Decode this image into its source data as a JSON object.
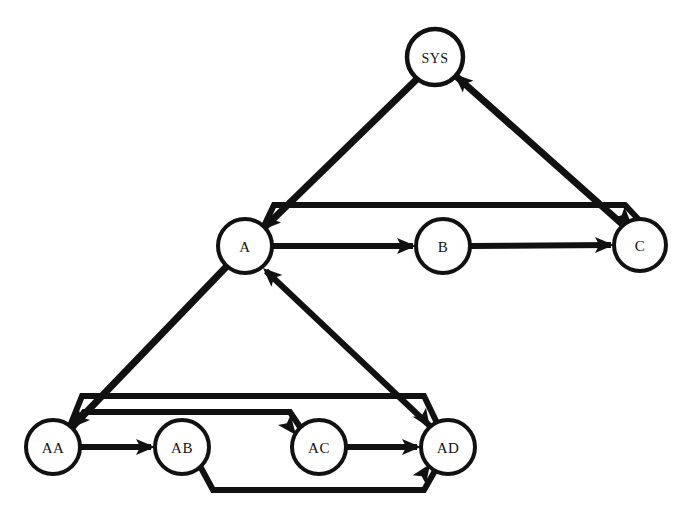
{
  "diagram": {
    "background_color": "#ffffff",
    "stroke_color": "#111111",
    "fill_color": "#ffffff",
    "width": 688,
    "height": 522,
    "nodes": [
      {
        "id": "SYS",
        "label": "SYS",
        "cx": 435,
        "cy": 57,
        "r": 28,
        "level": 0
      },
      {
        "id": "A",
        "label": "A",
        "cx": 245,
        "cy": 246,
        "r": 27,
        "level": 1
      },
      {
        "id": "B",
        "label": "B",
        "cx": 443,
        "cy": 246,
        "r": 27,
        "level": 1
      },
      {
        "id": "C",
        "label": "C",
        "cx": 640,
        "cy": 245,
        "r": 26,
        "level": 1
      },
      {
        "id": "AA",
        "label": "AA",
        "cx": 53,
        "cy": 447,
        "r": 27,
        "level": 2
      },
      {
        "id": "AB",
        "label": "AB",
        "cx": 182,
        "cy": 447,
        "r": 27,
        "level": 2
      },
      {
        "id": "AC",
        "label": "AC",
        "cx": 319,
        "cy": 447,
        "r": 27,
        "level": 2
      },
      {
        "id": "AD",
        "label": "AD",
        "cx": 448,
        "cy": 447,
        "r": 27,
        "level": 2
      }
    ],
    "edges": [
      {
        "id": "sys-a",
        "from": "SYS",
        "to": "A",
        "kind": "diagonal",
        "stroke_width": 7,
        "path": "M 417 79 L 265 227",
        "arrow_at": [
          262,
          230
        ],
        "arrow_angle": 135.5
      },
      {
        "id": "c-sys",
        "from": "C",
        "to": "SYS",
        "kind": "diagonal",
        "stroke_width": 7,
        "path": "M 622 224 L 457 77",
        "arrow_at": [
          454,
          74
        ],
        "arrow_angle": 221.7
      },
      {
        "id": "a-b",
        "from": "A",
        "to": "B",
        "kind": "straight",
        "stroke_width": 6,
        "path": "M 272 246 L 413 246",
        "arrow_at": [
          416,
          246
        ],
        "arrow_angle": 0
      },
      {
        "id": "b-c",
        "from": "B",
        "to": "C",
        "kind": "straight",
        "stroke_width": 6,
        "path": "M 470 246 L 611 245",
        "arrow_at": [
          614,
          245
        ],
        "arrow_angle": 0
      },
      {
        "id": "a-c",
        "from": "A",
        "to": "C",
        "kind": "bypass-over",
        "stroke_width": 6,
        "path": "M 263 228 L 274 205 L 625 205 L 640 221",
        "arrow_at": [
          632,
          226
        ],
        "arrow_angle": 46
      },
      {
        "id": "a-aa",
        "from": "A",
        "to": "AA",
        "kind": "diagonal",
        "stroke_width": 7,
        "path": "M 227 266 L 75 424",
        "arrow_at": [
          71,
          428
        ],
        "arrow_angle": 134
      },
      {
        "id": "ad-a",
        "from": "AD",
        "to": "A",
        "kind": "diagonal",
        "stroke_width": 6,
        "path": "M 432 428 L 266 271",
        "arrow_at": [
          263,
          268
        ],
        "arrow_angle": 223
      },
      {
        "id": "aa-ab",
        "from": "AA",
        "to": "AB",
        "kind": "straight",
        "stroke_width": 6,
        "path": "M 80 447 L 151 447",
        "arrow_at": [
          155,
          447
        ],
        "arrow_angle": 0
      },
      {
        "id": "ac-ad",
        "from": "AC",
        "to": "AD",
        "kind": "straight",
        "stroke_width": 6,
        "path": "M 346 447 L 417 447",
        "arrow_at": [
          421,
          447
        ],
        "arrow_angle": 0
      },
      {
        "id": "aa-ac",
        "from": "AA",
        "to": "AC",
        "kind": "bypass-over",
        "stroke_width": 6,
        "path": "M 72 429 L 84 412 L 290 412 L 302 430",
        "arrow_at": [
          296,
          435
        ],
        "arrow_angle": 52
      },
      {
        "id": "aa-ad",
        "from": "AA",
        "to": "AD",
        "kind": "bypass-over",
        "stroke_width": 6,
        "path": "M 70 426 L 82 396 L 424 396 L 437 423",
        "arrow_at": [
          430,
          428
        ],
        "arrow_angle": 56
      },
      {
        "id": "ab-ad",
        "from": "AB",
        "to": "AD",
        "kind": "bypass-under",
        "stroke_width": 6,
        "path": "M 200 466 L 213 490 L 424 490 L 436 469",
        "arrow_at": [
          430,
          464
        ],
        "arrow_angle": -56
      }
    ],
    "icon_names": [
      "node-circle-icon",
      "arrowhead-icon"
    ]
  }
}
